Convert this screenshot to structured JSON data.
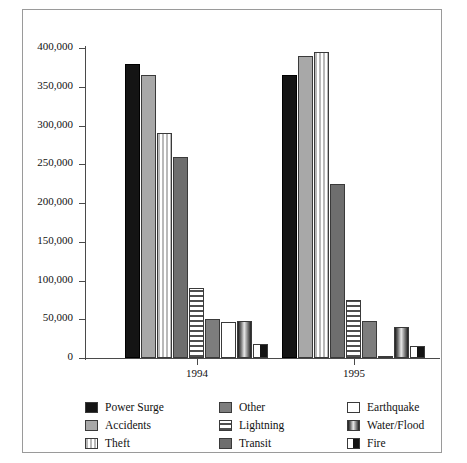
{
  "chart_data": {
    "type": "bar",
    "title": "",
    "subtitle": "",
    "xlabel": "",
    "ylabel": "",
    "categories": [
      "1994",
      "1995"
    ],
    "ylim": [
      0,
      400000
    ],
    "ytick_step": 50000,
    "yticks": [
      "400,000",
      "350,000",
      "300,000",
      "250,000",
      "200,000",
      "150,000",
      "100,000",
      "50,000",
      "0"
    ],
    "ytick_values": [
      400000,
      350000,
      300000,
      250000,
      200000,
      150000,
      100000,
      50000,
      0
    ],
    "grid": false,
    "legend_position": "bottom",
    "series": [
      {
        "name": "Power Surge",
        "pattern": "solid-black",
        "color": "#141414",
        "values": [
          380000,
          365000
        ]
      },
      {
        "name": "Accidents",
        "pattern": "solid-gray",
        "color": "#a8a8a8",
        "values": [
          365000,
          390000
        ]
      },
      {
        "name": "Theft",
        "pattern": "vertical-stripe",
        "color": "#b9b9b9",
        "values": [
          290000,
          395000
        ]
      },
      {
        "name": "Transit",
        "pattern": "transit-gray",
        "color": "#6e6e6e",
        "values": [
          260000,
          225000
        ]
      },
      {
        "name": "Lightning",
        "pattern": "horizontal-stripe",
        "color": "#4f4f4f",
        "values": [
          90000,
          75000
        ]
      },
      {
        "name": "Other",
        "pattern": "dark-gray",
        "color": "#7d7d7d",
        "values": [
          50000,
          48000
        ]
      },
      {
        "name": "Earthquake",
        "pattern": "white",
        "color": "#ffffff",
        "values": [
          47000,
          2000
        ]
      },
      {
        "name": "Water/Flood",
        "pattern": "gradient",
        "color": "#8a8a8a",
        "values": [
          48000,
          40000
        ]
      },
      {
        "name": "Fire",
        "pattern": "half-black",
        "color": "#141414",
        "values": [
          18000,
          15000
        ]
      }
    ]
  },
  "legend": {
    "entries": [
      {
        "label": "Power Surge",
        "swatch": "solid-black"
      },
      {
        "label": "Other",
        "swatch": "dark-gray"
      },
      {
        "label": "Earthquake",
        "swatch": "white"
      },
      {
        "label": "Accidents",
        "swatch": "solid-gray"
      },
      {
        "label": "Lightning",
        "swatch": "horizontal-stripe"
      },
      {
        "label": "Water/Flood",
        "swatch": "gradient"
      },
      {
        "label": "Theft",
        "swatch": "vertical-stripe"
      },
      {
        "label": "Transit",
        "swatch": "transit-gray"
      },
      {
        "label": "Fire",
        "swatch": "half-black"
      }
    ]
  },
  "colors": {
    "frame_border": "#9a9a9a",
    "axis": "#4a4a4a",
    "background": "#ffffff",
    "text": "#111111"
  }
}
